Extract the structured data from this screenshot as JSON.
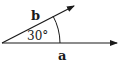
{
  "diagram": {
    "title": "",
    "vectors": [
      {
        "name": "a",
        "label": "a",
        "angle_deg": 0
      },
      {
        "name": "b",
        "label": "b",
        "angle_deg": 30
      }
    ],
    "angle_label": "30°",
    "stroke_color": "#1a1a1a",
    "background": "#ffffff"
  }
}
